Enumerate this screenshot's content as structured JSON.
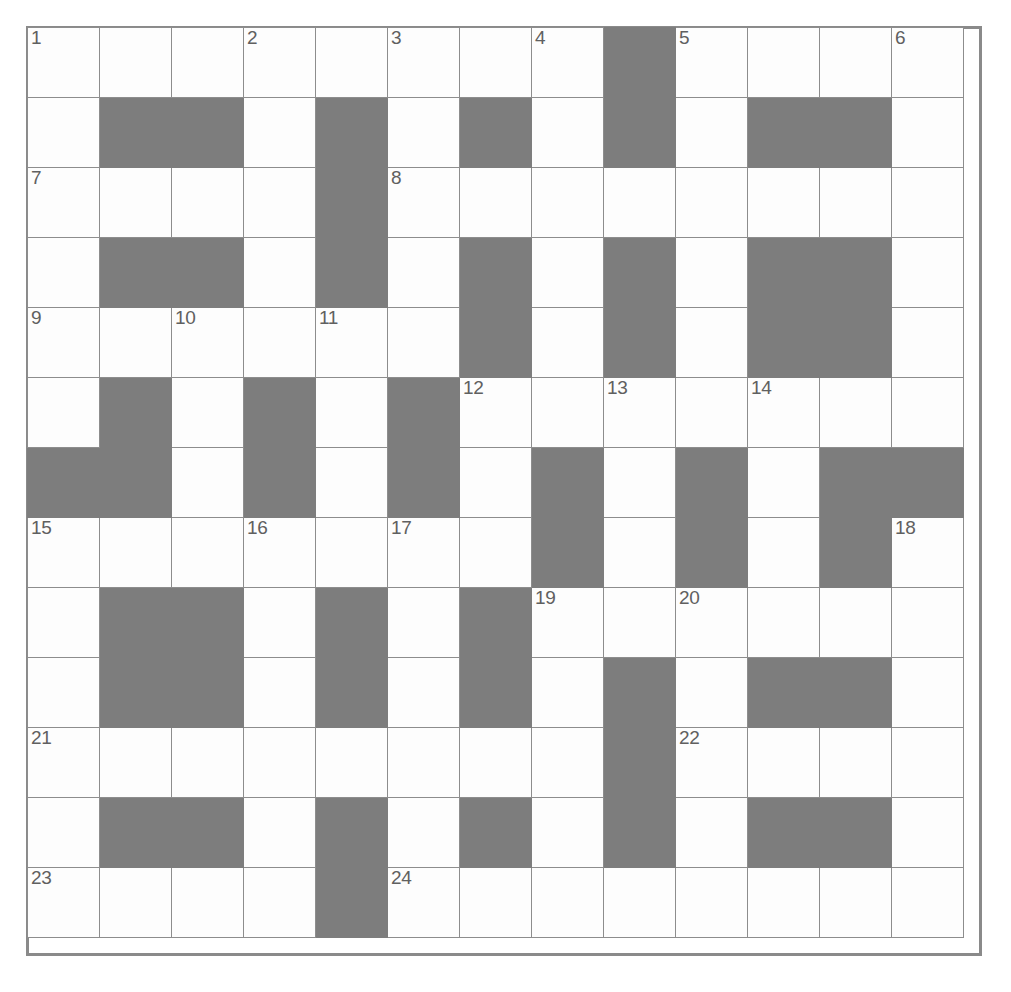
{
  "puzzle": {
    "title": "Crossword Grid",
    "rows": 13,
    "cols": 13,
    "colors": {
      "block": "#7d7d7d",
      "cell": "#ffffff",
      "gridline": "#8d8d8d",
      "number_text": "#606060",
      "frame": "#8a8a8a"
    },
    "legend": {
      "black_cell": "blocked-square",
      "white_cell": "answer-square"
    },
    "numbers_present": [
      1,
      2,
      3,
      4,
      5,
      6,
      7,
      8,
      9,
      10,
      11,
      12,
      13,
      14,
      15,
      16,
      17,
      18,
      19,
      20,
      21,
      22,
      23,
      24
    ],
    "grid": [
      [
        {
          "t": "w",
          "n": "1"
        },
        {
          "t": "w",
          "n": ""
        },
        {
          "t": "w",
          "n": ""
        },
        {
          "t": "w",
          "n": "2"
        },
        {
          "t": "w",
          "n": ""
        },
        {
          "t": "w",
          "n": "3"
        },
        {
          "t": "w",
          "n": ""
        },
        {
          "t": "w",
          "n": "4"
        },
        {
          "t": "b",
          "n": ""
        },
        {
          "t": "w",
          "n": "5"
        },
        {
          "t": "w",
          "n": ""
        },
        {
          "t": "w",
          "n": ""
        },
        {
          "t": "w",
          "n": "6"
        }
      ],
      [
        {
          "t": "w",
          "n": ""
        },
        {
          "t": "b",
          "n": ""
        },
        {
          "t": "b",
          "n": ""
        },
        {
          "t": "w",
          "n": ""
        },
        {
          "t": "b",
          "n": ""
        },
        {
          "t": "w",
          "n": ""
        },
        {
          "t": "b",
          "n": ""
        },
        {
          "t": "w",
          "n": ""
        },
        {
          "t": "b",
          "n": ""
        },
        {
          "t": "w",
          "n": ""
        },
        {
          "t": "b",
          "n": ""
        },
        {
          "t": "b",
          "n": ""
        },
        {
          "t": "w",
          "n": ""
        }
      ],
      [
        {
          "t": "w",
          "n": "7"
        },
        {
          "t": "w",
          "n": ""
        },
        {
          "t": "w",
          "n": ""
        },
        {
          "t": "w",
          "n": ""
        },
        {
          "t": "b",
          "n": ""
        },
        {
          "t": "w",
          "n": "8"
        },
        {
          "t": "w",
          "n": ""
        },
        {
          "t": "w",
          "n": ""
        },
        {
          "t": "w",
          "n": ""
        },
        {
          "t": "w",
          "n": ""
        },
        {
          "t": "w",
          "n": ""
        },
        {
          "t": "w",
          "n": ""
        },
        {
          "t": "w",
          "n": ""
        }
      ],
      [
        {
          "t": "w",
          "n": ""
        },
        {
          "t": "b",
          "n": ""
        },
        {
          "t": "b",
          "n": ""
        },
        {
          "t": "w",
          "n": ""
        },
        {
          "t": "b",
          "n": ""
        },
        {
          "t": "w",
          "n": ""
        },
        {
          "t": "b",
          "n": ""
        },
        {
          "t": "w",
          "n": ""
        },
        {
          "t": "b",
          "n": ""
        },
        {
          "t": "w",
          "n": ""
        },
        {
          "t": "b",
          "n": ""
        },
        {
          "t": "b",
          "n": ""
        },
        {
          "t": "w",
          "n": ""
        }
      ],
      [
        {
          "t": "w",
          "n": "9"
        },
        {
          "t": "w",
          "n": ""
        },
        {
          "t": "w",
          "n": "10"
        },
        {
          "t": "w",
          "n": ""
        },
        {
          "t": "w",
          "n": "11"
        },
        {
          "t": "w",
          "n": ""
        },
        {
          "t": "b",
          "n": ""
        },
        {
          "t": "w",
          "n": ""
        },
        {
          "t": "b",
          "n": ""
        },
        {
          "t": "w",
          "n": ""
        },
        {
          "t": "b",
          "n": ""
        },
        {
          "t": "b",
          "n": ""
        },
        {
          "t": "w",
          "n": ""
        }
      ],
      [
        {
          "t": "w",
          "n": ""
        },
        {
          "t": "b",
          "n": ""
        },
        {
          "t": "w",
          "n": ""
        },
        {
          "t": "b",
          "n": ""
        },
        {
          "t": "w",
          "n": ""
        },
        {
          "t": "b",
          "n": ""
        },
        {
          "t": "w",
          "n": "12"
        },
        {
          "t": "w",
          "n": ""
        },
        {
          "t": "w",
          "n": "13"
        },
        {
          "t": "w",
          "n": ""
        },
        {
          "t": "w",
          "n": "14"
        },
        {
          "t": "w",
          "n": ""
        },
        {
          "t": "w",
          "n": ""
        }
      ],
      [
        {
          "t": "b",
          "n": ""
        },
        {
          "t": "b",
          "n": ""
        },
        {
          "t": "w",
          "n": ""
        },
        {
          "t": "b",
          "n": ""
        },
        {
          "t": "w",
          "n": ""
        },
        {
          "t": "b",
          "n": ""
        },
        {
          "t": "w",
          "n": ""
        },
        {
          "t": "b",
          "n": ""
        },
        {
          "t": "w",
          "n": ""
        },
        {
          "t": "b",
          "n": ""
        },
        {
          "t": "w",
          "n": ""
        },
        {
          "t": "b",
          "n": ""
        },
        {
          "t": "b",
          "n": ""
        }
      ],
      [
        {
          "t": "w",
          "n": "15"
        },
        {
          "t": "w",
          "n": ""
        },
        {
          "t": "w",
          "n": ""
        },
        {
          "t": "w",
          "n": "16"
        },
        {
          "t": "w",
          "n": ""
        },
        {
          "t": "w",
          "n": "17"
        },
        {
          "t": "w",
          "n": ""
        },
        {
          "t": "b",
          "n": ""
        },
        {
          "t": "w",
          "n": ""
        },
        {
          "t": "b",
          "n": ""
        },
        {
          "t": "w",
          "n": ""
        },
        {
          "t": "b",
          "n": ""
        },
        {
          "t": "w",
          "n": "18"
        }
      ],
      [
        {
          "t": "w",
          "n": ""
        },
        {
          "t": "b",
          "n": ""
        },
        {
          "t": "b",
          "n": ""
        },
        {
          "t": "w",
          "n": ""
        },
        {
          "t": "b",
          "n": ""
        },
        {
          "t": "w",
          "n": ""
        },
        {
          "t": "b",
          "n": ""
        },
        {
          "t": "w",
          "n": "19"
        },
        {
          "t": "w",
          "n": ""
        },
        {
          "t": "w",
          "n": "20"
        },
        {
          "t": "w",
          "n": ""
        },
        {
          "t": "w",
          "n": ""
        },
        {
          "t": "w",
          "n": ""
        }
      ],
      [
        {
          "t": "w",
          "n": ""
        },
        {
          "t": "b",
          "n": ""
        },
        {
          "t": "b",
          "n": ""
        },
        {
          "t": "w",
          "n": ""
        },
        {
          "t": "b",
          "n": ""
        },
        {
          "t": "w",
          "n": ""
        },
        {
          "t": "b",
          "n": ""
        },
        {
          "t": "w",
          "n": ""
        },
        {
          "t": "b",
          "n": ""
        },
        {
          "t": "w",
          "n": ""
        },
        {
          "t": "b",
          "n": ""
        },
        {
          "t": "b",
          "n": ""
        },
        {
          "t": "w",
          "n": ""
        }
      ],
      [
        {
          "t": "w",
          "n": "21"
        },
        {
          "t": "w",
          "n": ""
        },
        {
          "t": "w",
          "n": ""
        },
        {
          "t": "w",
          "n": ""
        },
        {
          "t": "w",
          "n": ""
        },
        {
          "t": "w",
          "n": ""
        },
        {
          "t": "w",
          "n": ""
        },
        {
          "t": "w",
          "n": ""
        },
        {
          "t": "b",
          "n": ""
        },
        {
          "t": "w",
          "n": "22"
        },
        {
          "t": "w",
          "n": ""
        },
        {
          "t": "w",
          "n": ""
        },
        {
          "t": "w",
          "n": ""
        }
      ],
      [
        {
          "t": "w",
          "n": ""
        },
        {
          "t": "b",
          "n": ""
        },
        {
          "t": "b",
          "n": ""
        },
        {
          "t": "w",
          "n": ""
        },
        {
          "t": "b",
          "n": ""
        },
        {
          "t": "w",
          "n": ""
        },
        {
          "t": "b",
          "n": ""
        },
        {
          "t": "w",
          "n": ""
        },
        {
          "t": "b",
          "n": ""
        },
        {
          "t": "w",
          "n": ""
        },
        {
          "t": "b",
          "n": ""
        },
        {
          "t": "b",
          "n": ""
        },
        {
          "t": "w",
          "n": ""
        }
      ],
      [
        {
          "t": "w",
          "n": "23"
        },
        {
          "t": "w",
          "n": ""
        },
        {
          "t": "w",
          "n": ""
        },
        {
          "t": "w",
          "n": ""
        },
        {
          "t": "b",
          "n": ""
        },
        {
          "t": "w",
          "n": "24"
        },
        {
          "t": "w",
          "n": ""
        },
        {
          "t": "w",
          "n": ""
        },
        {
          "t": "w",
          "n": ""
        },
        {
          "t": "w",
          "n": ""
        },
        {
          "t": "w",
          "n": ""
        },
        {
          "t": "w",
          "n": ""
        },
        {
          "t": "w",
          "n": ""
        }
      ]
    ]
  }
}
